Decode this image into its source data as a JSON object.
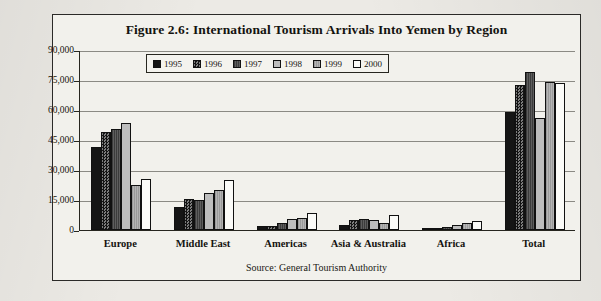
{
  "figure": {
    "title": "Figure 2.6: International Tourism Arrivals Into Yemen by Region",
    "source": "Source: General Tourism Authority"
  },
  "chart_data": {
    "type": "bar",
    "title": "Figure 2.6: International Tourism Arrivals Into Yemen by Region",
    "xlabel": "",
    "ylabel": "",
    "ylim": [
      0,
      90000
    ],
    "yticks": [
      0,
      15000,
      30000,
      45000,
      60000,
      75000,
      90000
    ],
    "ytick_labels": [
      "0",
      "15,000",
      "30,000",
      "45,000",
      "60,000",
      "75,000",
      "90,000"
    ],
    "grid": true,
    "legend_position": "top-center",
    "categories": [
      "Europe",
      "Middle East",
      "Americas",
      "Asia & Australia",
      "Africa",
      "Total"
    ],
    "series": [
      {
        "name": "1995",
        "fill": "solid-black",
        "color": "#151515",
        "values": [
          41500,
          11500,
          2000,
          2500,
          1000,
          59000
        ]
      },
      {
        "name": "1996",
        "fill": "checker-dark",
        "color": "#2d2d2d",
        "values": [
          49000,
          15500,
          2000,
          5000,
          1000,
          72500
        ]
      },
      {
        "name": "1997",
        "fill": "hatch-dark",
        "color": "#4d4d4d",
        "values": [
          50500,
          15000,
          3500,
          5500,
          1500,
          79000
        ]
      },
      {
        "name": "1998",
        "fill": "light-gray",
        "color": "#bdbdbd",
        "values": [
          53500,
          18500,
          5500,
          5000,
          2500,
          56000
        ]
      },
      {
        "name": "1999",
        "fill": "hatch-light",
        "color": "#a8a8a8",
        "values": [
          22500,
          20000,
          6000,
          3500,
          3500,
          74000
        ]
      },
      {
        "name": "2000",
        "fill": "white",
        "color": "#fbfbf8",
        "values": [
          25500,
          25000,
          8500,
          7500,
          4500,
          73500
        ]
      }
    ]
  }
}
